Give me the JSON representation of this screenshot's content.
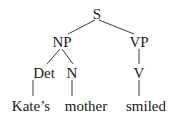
{
  "diagram": {
    "type": "syntax-tree",
    "nodes": {
      "s": "S",
      "np": "NP",
      "vp": "VP",
      "det": "Det",
      "n": "N",
      "v": "V",
      "leaf_kates": "Kate’s",
      "leaf_mother": "mother",
      "leaf_smiled": "smiled"
    },
    "edges": [
      [
        "S",
        "NP"
      ],
      [
        "S",
        "VP"
      ],
      [
        "NP",
        "Det"
      ],
      [
        "NP",
        "N"
      ],
      [
        "VP",
        "V"
      ],
      [
        "Det",
        "Kate’s"
      ],
      [
        "N",
        "mother"
      ],
      [
        "V",
        "smiled"
      ]
    ],
    "line_color": "#3a3a3a",
    "text_color": "#1a1a1a"
  }
}
